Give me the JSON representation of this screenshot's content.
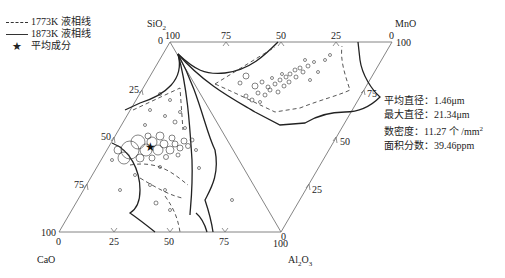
{
  "legend": {
    "items": [
      {
        "style": "dashed",
        "label": "1773K 液相线"
      },
      {
        "style": "solid",
        "label": "1873K 液相线"
      },
      {
        "style": "star",
        "symbol": "★",
        "label": "平均成分"
      }
    ]
  },
  "vertices": {
    "sio2": {
      "base": "SiO",
      "sub": "2"
    },
    "mno": {
      "base": "MnO"
    },
    "cao": {
      "base": "CaO"
    },
    "al2o3": {
      "base": "Al",
      "sub1": "2",
      "mid": "O",
      "sub2": "3"
    }
  },
  "axis_ticks": {
    "top": [
      "100",
      "75",
      "50",
      "25",
      "0"
    ],
    "top_left_zero": "0",
    "left": [
      "25",
      "50",
      "75",
      "100"
    ],
    "bottom": [
      "0",
      "25",
      "50",
      "75",
      "100"
    ],
    "bottom_right_zero": "0",
    "right": [
      "75",
      "50",
      "25"
    ],
    "mno_corner": "100"
  },
  "stats": {
    "avg_diameter": {
      "label": "平均直径：",
      "value": "1.46μm"
    },
    "max_diameter": {
      "label": "最大直径：",
      "value": "21.34μm"
    },
    "number_density": {
      "label": "数密度：",
      "value": "11.27 个 /mm",
      "sup": "2"
    },
    "area_fraction": {
      "label": "面积分数：",
      "value": "39.46ppm"
    }
  },
  "colors": {
    "line": "#333333",
    "axis": "#777777",
    "marker": "#222222"
  }
}
